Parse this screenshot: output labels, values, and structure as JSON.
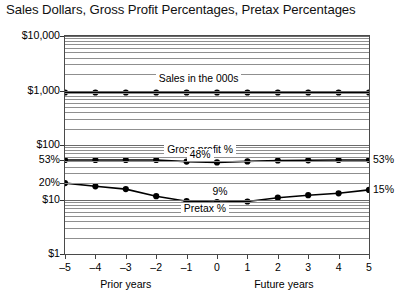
{
  "chart_data": {
    "type": "line",
    "title": "Sales Dollars, Gross Profit Percentages, Pretax Percentages",
    "xlabel": "",
    "ylabel": "",
    "yscale": "log",
    "ylim": [
      1,
      10000
    ],
    "grid": true,
    "legend": "inline-annotations",
    "x": [
      -5,
      -4,
      -3,
      -2,
      -1,
      0,
      1,
      2,
      3,
      4,
      5
    ],
    "xticklabels": [
      "–5",
      "–4",
      "–3",
      "–2",
      "–1",
      "0",
      "1",
      "2",
      "3",
      "4",
      "5"
    ],
    "yticklabels": [
      "$10,000",
      "$1,000",
      "$100",
      "53%",
      "20%",
      "$10",
      "$1"
    ],
    "ytickvalues": [
      10000,
      1000,
      100,
      53,
      20,
      10,
      1
    ],
    "x_group_labels": [
      {
        "text": "Prior years",
        "center_x": -3
      },
      {
        "text": "Future years",
        "center_x": 2.2
      }
    ],
    "series": [
      {
        "name": "Sales in the 000s",
        "label": "Sales in the 000s",
        "values": [
          920,
          920,
          920,
          920,
          920,
          920,
          920,
          920,
          920,
          920,
          920
        ]
      },
      {
        "name": "Gross profit %",
        "label": "Gross profit %",
        "annotation": "48%",
        "end_label": "53%",
        "values": [
          53,
          53,
          53,
          53,
          49.5,
          48,
          50,
          52,
          52.5,
          53,
          53
        ]
      },
      {
        "name": "Pretax %",
        "label": "Pretax %",
        "annotation": "9%",
        "end_label": "15%",
        "values": [
          20,
          17.5,
          15.5,
          11.5,
          9.3,
          9,
          9.2,
          10.8,
          12,
          13,
          15
        ]
      }
    ],
    "annotations": [
      {
        "text": "Sales in the 000s",
        "x": -0.6,
        "y": 1600
      },
      {
        "text": "Gross profit %",
        "x": -0.55,
        "y": 82
      },
      {
        "text": "48%",
        "x": -0.55,
        "y": 66
      },
      {
        "text": "9%",
        "x": 0.1,
        "y": 13.5
      },
      {
        "text": "Pretax %",
        "x": -0.4,
        "y": 6.6
      }
    ],
    "edge_labels": [
      {
        "text": "53%",
        "y": 53
      },
      {
        "text": "15%",
        "y": 15
      }
    ]
  }
}
